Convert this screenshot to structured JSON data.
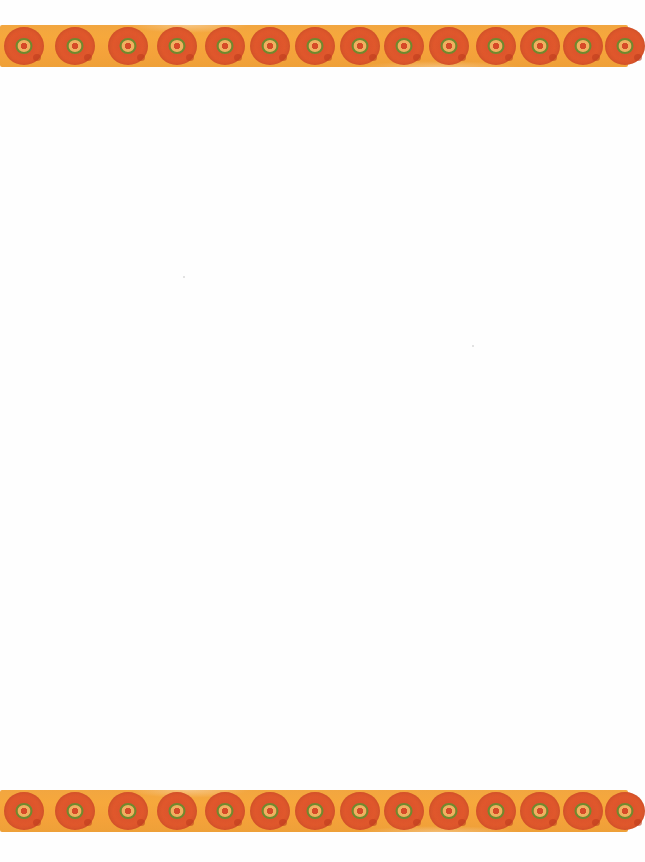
{
  "page": {
    "type": "decorative stationery",
    "background_color": "#fefefe",
    "body_text": ""
  },
  "border": {
    "style": "watercolor orange band with concentric circle motifs",
    "colors": {
      "band": "#f4a53c",
      "circle_outer": "#dc552b",
      "ring": "#6f8a2e",
      "ring_inner": "#f0b060",
      "center": "#d64a28"
    },
    "top": {
      "y": 25,
      "motif_centers_x": [
        24,
        75,
        128,
        177,
        225,
        270,
        315,
        360,
        404,
        449,
        496,
        540,
        583,
        625
      ]
    },
    "bottom": {
      "y": 790,
      "motif_centers_x": [
        24,
        75,
        128,
        177,
        225,
        270,
        315,
        360,
        404,
        449,
        496,
        540,
        583,
        625
      ]
    }
  }
}
